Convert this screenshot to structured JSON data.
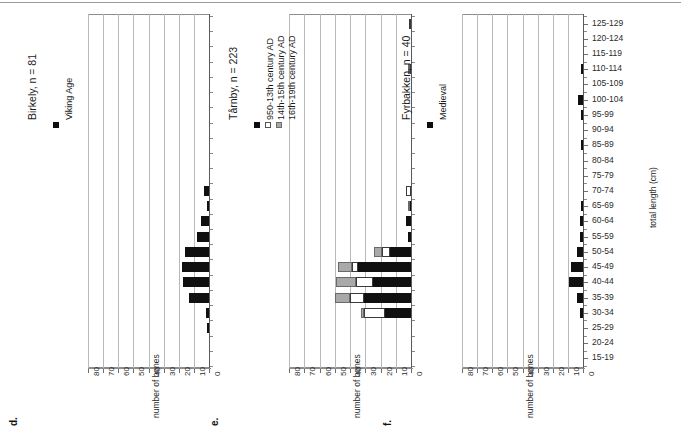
{
  "figure": {
    "axis_title_value": "number of bones",
    "axis_title_category": "total length (cm)",
    "value_ticks": [
      "80",
      "70",
      "60",
      "50",
      "40",
      "30",
      "20",
      "10",
      "0"
    ],
    "categories": [
      "125-129",
      "120-124",
      "115-119",
      "110-114",
      "105-109",
      "100-104",
      "95-99",
      "90-94",
      "85-89",
      "80-84",
      "75-79",
      "70-74",
      "65-69",
      "60-64",
      "55-59",
      "50-54",
      "45-49",
      "40-44",
      "35-39",
      "30-34",
      "25-29",
      "20-24",
      "15-19"
    ]
  },
  "colors": {
    "series_black": "#101010",
    "series_white": "#ffffff",
    "series_grey": "#a9a9a9",
    "gridline": "#b9b9b9",
    "axis": "#5a5a5a",
    "text": "#1a1a1a"
  },
  "panels": [
    {
      "letter": "d.",
      "title": "Birkely, n = 81",
      "legend": [
        {
          "label": "Viking Age",
          "swatch": "black"
        }
      ],
      "chart_data": {
        "type": "bar",
        "title": "Birkely, n = 81",
        "xlabel": "number of bones",
        "ylabel": "total length (cm)",
        "xlim": [
          0,
          80
        ],
        "grid": true,
        "legend_position": "top-left",
        "categories": [
          "125-129",
          "120-124",
          "115-119",
          "110-114",
          "105-109",
          "100-104",
          "95-99",
          "90-94",
          "85-89",
          "80-84",
          "75-79",
          "70-74",
          "65-69",
          "60-64",
          "55-59",
          "50-54",
          "45-49",
          "40-44",
          "35-39",
          "30-34",
          "25-29",
          "20-24",
          "15-19"
        ],
        "series": [
          {
            "name": "Viking Age",
            "color": "#101010",
            "values": [
              0,
              0,
              0,
              0,
              0,
              0,
              0,
              0,
              0,
              0,
              0,
              3,
              1,
              5,
              8,
              16,
              18,
              17,
              13,
              2,
              1,
              0,
              0
            ]
          }
        ]
      }
    },
    {
      "letter": "e.",
      "title": "Tårnby, n = 223",
      "legend": [
        {
          "label": "950-13th century AD",
          "swatch": "black"
        },
        {
          "label": "14th-15th century AD",
          "swatch": "white"
        },
        {
          "label": "16th-19th century AD",
          "swatch": "grey"
        }
      ],
      "chart_data": {
        "type": "bar",
        "stacked": true,
        "title": "Tårnby, n = 223",
        "xlabel": "number of bones",
        "ylabel": "total length (cm)",
        "xlim": [
          0,
          80
        ],
        "grid": true,
        "legend_position": "top-left",
        "categories": [
          "125-129",
          "120-124",
          "115-119",
          "110-114",
          "105-109",
          "100-104",
          "95-99",
          "90-94",
          "85-89",
          "80-84",
          "75-79",
          "70-74",
          "65-69",
          "60-64",
          "55-59",
          "50-54",
          "45-49",
          "40-44",
          "35-39",
          "30-34",
          "25-29",
          "20-24",
          "15-19"
        ],
        "series": [
          {
            "name": "950-13th century AD",
            "color": "#101010",
            "values": [
              0,
              0,
              0,
              0,
              0,
              0,
              0,
              0,
              0,
              0,
              0,
              0,
              1,
              3,
              2,
              14,
              35,
              25,
              31,
              17,
              0,
              0,
              0
            ]
          },
          {
            "name": "14th-15th century AD",
            "color": "#ffffff",
            "values": [
              1,
              0,
              0,
              1,
              0,
              0,
              0,
              0,
              0,
              0,
              0,
              3,
              0,
              0,
              0,
              5,
              4,
              11,
              9,
              14,
              0,
              0,
              0
            ]
          },
          {
            "name": "16th-19th century AD",
            "color": "#a9a9a9",
            "values": [
              0,
              0,
              0,
              1,
              0,
              0,
              0,
              0,
              0,
              0,
              0,
              0,
              1,
              0,
              0,
              5,
              9,
              13,
              10,
              2,
              0,
              0,
              0
            ]
          }
        ]
      }
    },
    {
      "letter": "f.",
      "title": "Fyrbakken, n = 40",
      "legend": [
        {
          "label": "Medieval",
          "swatch": "black"
        }
      ],
      "chart_data": {
        "type": "bar",
        "title": "Fyrbakken, n = 40",
        "xlabel": "number of bones",
        "ylabel": "total length (cm)",
        "xlim": [
          0,
          80
        ],
        "grid": true,
        "legend_position": "top-left",
        "categories": [
          "125-129",
          "120-124",
          "115-119",
          "110-114",
          "105-109",
          "100-104",
          "95-99",
          "90-94",
          "85-89",
          "80-84",
          "75-79",
          "70-74",
          "65-69",
          "60-64",
          "55-59",
          "50-54",
          "45-49",
          "40-44",
          "35-39",
          "30-34",
          "25-29",
          "20-24",
          "15-19"
        ],
        "series": [
          {
            "name": "Medieval",
            "color": "#101010",
            "values": [
              0,
              0,
              0,
              1,
              0,
              3,
              1,
              0,
              1,
              0,
              0,
              0,
              1,
              2,
              2,
              4,
              8,
              9,
              4,
              2,
              0,
              0,
              0
            ]
          }
        ]
      }
    }
  ]
}
